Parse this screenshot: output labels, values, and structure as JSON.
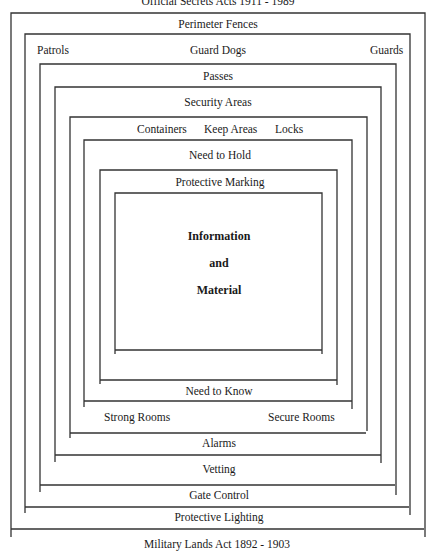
{
  "title_top": "Official Secrets Acts 1911 - 1989",
  "title_bottom": "Military Lands Act 1892 - 1903",
  "layers": [
    {
      "id": 1,
      "top_label": "Perimeter Fences",
      "bottom_label": "Protective Lighting"
    },
    {
      "id": 2,
      "top_labels": [
        "Patrols",
        "Guard Dogs",
        "Guards"
      ],
      "bottom_label": "Gate Control"
    },
    {
      "id": 3,
      "top_label": "Passes",
      "bottom_label": "Vetting"
    },
    {
      "id": 4,
      "top_label": "Security Areas",
      "bottom_label": "Alarms"
    },
    {
      "id": 5,
      "top_labels": [
        "Containers",
        "Keep Areas",
        "Locks"
      ],
      "bottom_labels": [
        "Strong Rooms",
        "Secure Rooms"
      ]
    },
    {
      "id": 6,
      "top_label": "Need to Hold",
      "bottom_label": "Need to Know"
    },
    {
      "id": 7,
      "top_label": "Protective Marking",
      "bottom_label": ""
    },
    {
      "id": 8,
      "center_lines": [
        "Information",
        "and",
        "Material"
      ]
    }
  ],
  "colors": {
    "line": "#333333",
    "text": "#1a1a1a",
    "background": "#ffffff"
  }
}
